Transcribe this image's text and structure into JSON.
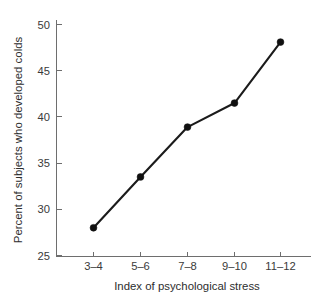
{
  "chart_data": {
    "type": "line",
    "title": "",
    "xlabel": "Index of psychological stress",
    "ylabel": "Percent of subjects who developed colds",
    "categories": [
      "3–4",
      "5–6",
      "7–8",
      "9–10",
      "11–12"
    ],
    "values": [
      28.0,
      33.5,
      38.9,
      41.5,
      48.1
    ],
    "series": [
      {
        "name": "Percent who developed colds",
        "values": [
          28.0,
          33.5,
          38.9,
          41.5,
          48.1
        ]
      }
    ],
    "ylim": [
      25,
      50
    ],
    "yticks": [
      25,
      30,
      35,
      40,
      45,
      50
    ],
    "ytick_labels": [
      "25",
      "30",
      "35",
      "40",
      "45",
      "50"
    ],
    "xtick_labels": [
      "3–4",
      "5–6",
      "7–8",
      "9–10",
      "11–12"
    ],
    "grid": false,
    "legend": false,
    "legend_position": "none",
    "marker": "filled-circle",
    "line_color": "#1b1b1b",
    "marker_color": "#101010",
    "axis_color": "#6e6e6e",
    "background": "#ffffff"
  },
  "axes": {
    "y_title": "Percent of subjects who developed colds",
    "x_title": "Index of psychological stress",
    "y_ticks": [
      {
        "label": "50",
        "value": 50
      },
      {
        "label": "45",
        "value": 45
      },
      {
        "label": "40",
        "value": 40
      },
      {
        "label": "35",
        "value": 35
      },
      {
        "label": "30",
        "value": 30
      },
      {
        "label": "25",
        "value": 25
      }
    ],
    "x_ticks": [
      {
        "label": "3–4"
      },
      {
        "label": "5–6"
      },
      {
        "label": "7–8"
      },
      {
        "label": "9–10"
      },
      {
        "label": "11–12"
      }
    ]
  }
}
